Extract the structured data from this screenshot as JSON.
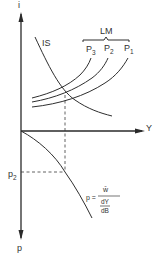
{
  "diagram": {
    "type": "IS-LM with price relationship",
    "axes": {
      "vertical_top_label": "i",
      "horizontal_label": "Y",
      "vertical_bottom_label": "p"
    },
    "curves": {
      "is_label": "IS",
      "lm_group_label": "LM",
      "lm_curves": [
        {
          "label": "P",
          "sub": "3"
        },
        {
          "label": "P",
          "sub": "2"
        },
        {
          "label": "P",
          "sub": "1"
        }
      ]
    },
    "markers": {
      "p2_label": "p",
      "p2_sub": "2"
    },
    "formula": {
      "lhs": "p =",
      "numerator": "w̄",
      "denominator_top": "dY",
      "denominator_bottom": "dB"
    }
  }
}
